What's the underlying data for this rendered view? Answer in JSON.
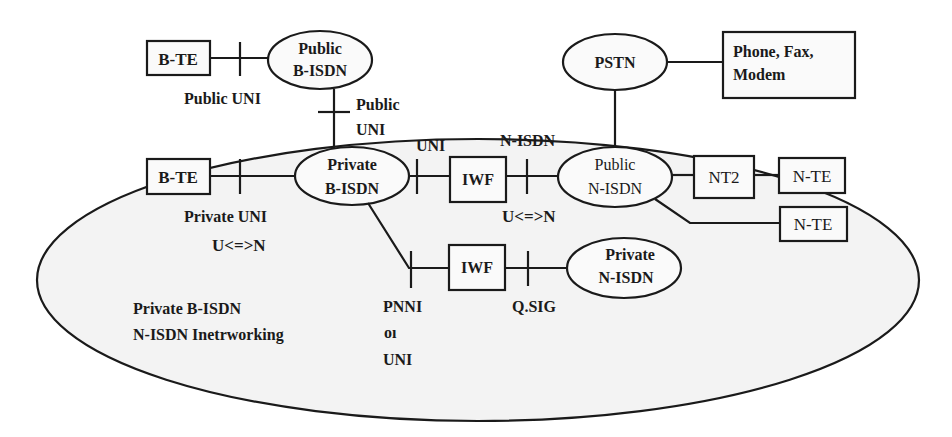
{
  "diagram": {
    "region": {
      "label_line1": "Private B-ISDN",
      "label_line2": "N-ISDN Inetrworking"
    },
    "nodes": {
      "bte_public": "B-TE",
      "public_bisdn_line1": "Public",
      "public_bisdn_line2": "B-ISDN",
      "pstn": "PSTN",
      "phone_line1": "Phone, Fax,",
      "phone_line2": "Modem",
      "bte_private": "B-TE",
      "private_bisdn_line1": "Private",
      "private_bisdn_line2": "B-ISDN",
      "iwf_top": "IWF",
      "public_nisdn_line1": "Public",
      "public_nisdn_line2": "N-ISDN",
      "nt2": "NT2",
      "nte_1": "N-TE",
      "nte_2": "N-TE",
      "iwf_bottom": "IWF",
      "private_nisdn_line1": "Private",
      "private_nisdn_line2": "N-ISDN"
    },
    "interface_labels": {
      "public_uni_left": "Public UNI",
      "public_uni_vertical_line1": "Public",
      "public_uni_vertical_line2": "UNI",
      "uni_top": "UNI",
      "nisdn_top": "N-ISDN",
      "private_uni": "Private UNI",
      "u_n_left": "U<=>N",
      "u_n_right": "U<=>N",
      "pnni_line1": "PNNI",
      "pnni_line2": "oı",
      "pnni_line3": "UNI",
      "qsig": "Q.SIG"
    },
    "colors": {
      "line": "#1a1a1a",
      "region_fill": "#f3f3f3",
      "background": "#ffffff"
    }
  }
}
